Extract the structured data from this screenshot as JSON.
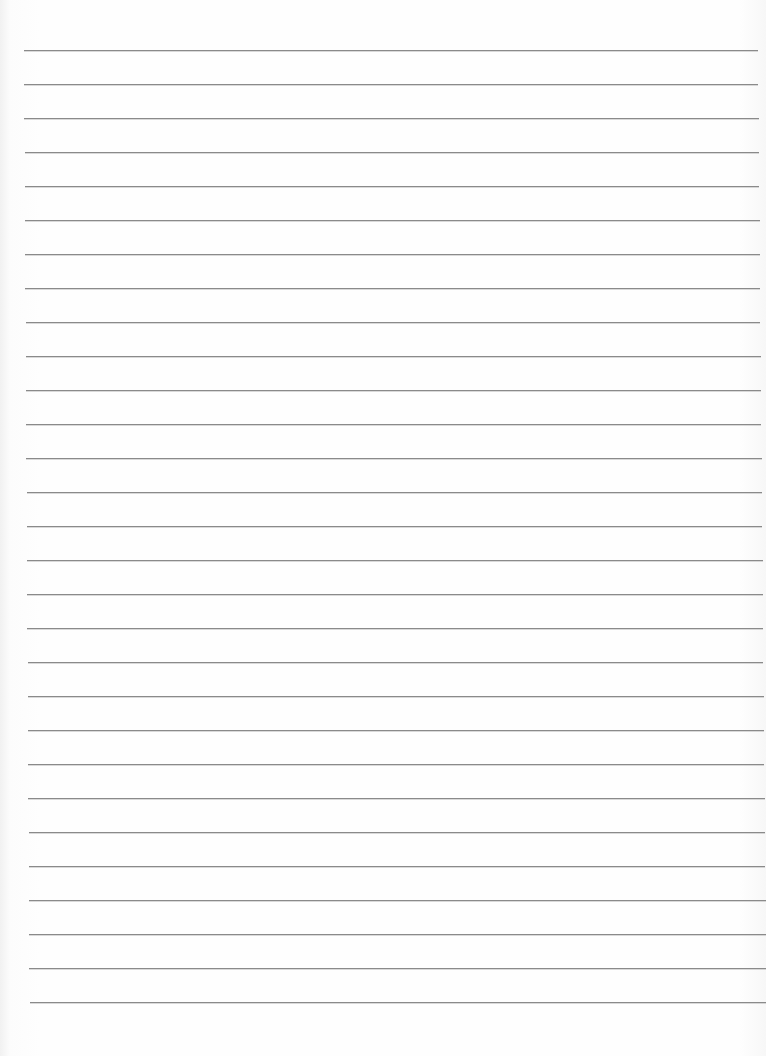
{
  "document": {
    "type": "lined-paper",
    "line_count": 29,
    "first_line_y": 50,
    "line_spacing": 34,
    "line_color": "#8a8a8a",
    "background_color": "#fdfdfd",
    "text": ""
  }
}
